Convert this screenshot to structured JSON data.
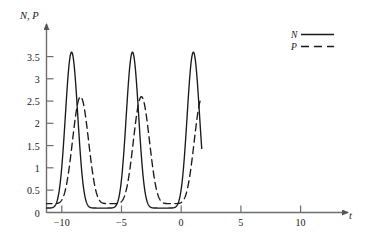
{
  "chart_data": {
    "type": "line",
    "title": "",
    "subtitle": "",
    "xlabel": "t",
    "ylabel": "N, P",
    "xlim": [
      -11.2,
      13.0
    ],
    "ylim": [
      0,
      3.85
    ],
    "grid": false,
    "legend_position": "top-right",
    "xticks": [
      -10,
      -5,
      0,
      5,
      10
    ],
    "xtick_labels": [
      "−10",
      "−5",
      "0",
      "5",
      "10"
    ],
    "yticks": [
      0,
      0.5,
      1,
      1.5,
      2,
      2.5,
      3,
      3.5
    ],
    "ytick_labels": [
      "0",
      "0.5",
      "1",
      "1.5",
      "2",
      "2.5",
      "3",
      "3.5"
    ],
    "series": [
      {
        "name": "N",
        "style": "solid",
        "color": "#1a1a1a",
        "peak_value": 3.6,
        "min_value": 0.1,
        "period": 5.1,
        "peak_times": [
          -8.1,
          -3.05,
          2.05,
          7.15,
          12.25
        ],
        "trough_times": [
          -10.5,
          -5.5,
          -0.45,
          4.6,
          9.7
        ],
        "edge_left_value": 0.72,
        "edge_right_value": 3.6
      },
      {
        "name": "P",
        "style": "dashed",
        "color": "#1a1a1a",
        "peak_value": 2.6,
        "min_value": 0.2,
        "period": 5.1,
        "peak_times": [
          -7.35,
          -2.3,
          2.8,
          7.9
        ],
        "trough_times": [
          -9.8,
          -4.7,
          0.35,
          5.45,
          10.55
        ],
        "edge_left_value": 0.14,
        "edge_right_value": 1.15
      }
    ]
  },
  "axis": {
    "y_label": "N, P",
    "x_label": "t"
  },
  "legend": {
    "entries": [
      {
        "label": "N",
        "style": "solid"
      },
      {
        "label": "P",
        "style": "dashed"
      }
    ]
  }
}
